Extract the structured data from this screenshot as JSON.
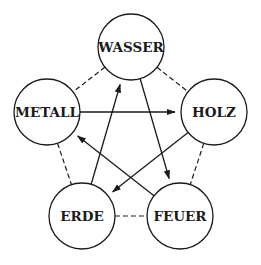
{
  "diagram": {
    "nodes": [
      {
        "id": "wasser",
        "label": "WASSER",
        "cx": 131,
        "cy": 47,
        "r": 33
      },
      {
        "id": "metall",
        "label": "METALL",
        "cx": 47,
        "cy": 112,
        "r": 33
      },
      {
        "id": "holz",
        "label": "HOLZ",
        "cx": 214,
        "cy": 112,
        "r": 33
      },
      {
        "id": "erde",
        "label": "ERDE",
        "cx": 82,
        "cy": 216,
        "r": 33
      },
      {
        "id": "feuer",
        "label": "FEUER",
        "cx": 180,
        "cy": 216,
        "r": 33
      }
    ],
    "arrows": [
      {
        "from": "metall",
        "to": "holz"
      },
      {
        "from": "wasser",
        "to": "feuer"
      },
      {
        "from": "holz",
        "to": "erde"
      },
      {
        "from": "feuer",
        "to": "metall"
      },
      {
        "from": "erde",
        "to": "wasser"
      }
    ],
    "dashed_links": [
      {
        "a": "wasser",
        "b": "metall"
      },
      {
        "a": "wasser",
        "b": "holz"
      },
      {
        "a": "metall",
        "b": "erde"
      },
      {
        "a": "holz",
        "b": "feuer"
      },
      {
        "a": "erde",
        "b": "feuer"
      }
    ],
    "colors": {
      "stroke": "#1a1a1a",
      "fill": "#ffffff"
    }
  }
}
